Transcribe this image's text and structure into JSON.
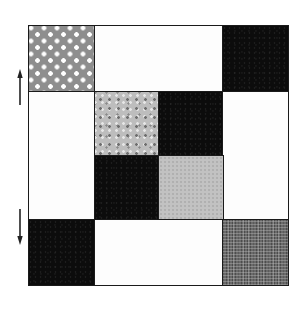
{
  "figure": {
    "grid": {
      "rows": 4,
      "cols": 4,
      "tiles": [
        {
          "id": "r0c0",
          "row": 0,
          "col": 0,
          "rowspan": 1,
          "colspan": 1,
          "pattern": "white-dots-on-gray",
          "color": "#8e8e8e"
        },
        {
          "id": "r0c1",
          "row": 0,
          "col": 1,
          "rowspan": 1,
          "colspan": 2,
          "pattern": "white",
          "color": "#fdfdfd"
        },
        {
          "id": "r0c3",
          "row": 0,
          "col": 3,
          "rowspan": 1,
          "colspan": 1,
          "pattern": "black",
          "color": "#0c0c0c"
        },
        {
          "id": "r1c0",
          "row": 1,
          "col": 0,
          "rowspan": 2,
          "colspan": 1,
          "pattern": "white",
          "color": "#fdfdfd"
        },
        {
          "id": "r1c1",
          "row": 1,
          "col": 1,
          "rowspan": 1,
          "colspan": 1,
          "pattern": "speckled-light-gray",
          "color": "#bdbdbd"
        },
        {
          "id": "r1c2",
          "row": 1,
          "col": 2,
          "rowspan": 1,
          "colspan": 1,
          "pattern": "black",
          "color": "#0c0c0c"
        },
        {
          "id": "r1c3",
          "row": 1,
          "col": 3,
          "rowspan": 2,
          "colspan": 1,
          "pattern": "white",
          "color": "#fdfdfd"
        },
        {
          "id": "r2c1",
          "row": 2,
          "col": 1,
          "rowspan": 1,
          "colspan": 1,
          "pattern": "black",
          "color": "#0c0c0c"
        },
        {
          "id": "r2c2",
          "row": 2,
          "col": 2,
          "rowspan": 1,
          "colspan": 1,
          "pattern": "light-gray",
          "color": "#c2c2c2"
        },
        {
          "id": "r3c0",
          "row": 3,
          "col": 0,
          "rowspan": 1,
          "colspan": 1,
          "pattern": "black",
          "color": "#0c0c0c"
        },
        {
          "id": "r3c1",
          "row": 3,
          "col": 1,
          "rowspan": 1,
          "colspan": 2,
          "pattern": "white",
          "color": "#fdfdfd"
        },
        {
          "id": "r3c3",
          "row": 3,
          "col": 3,
          "rowspan": 1,
          "colspan": 1,
          "pattern": "crosshatch-gray",
          "color": "#6a6a6a"
        }
      ]
    },
    "arrows": [
      {
        "id": "arrow-up",
        "direction": "up",
        "side": "left"
      },
      {
        "id": "arrow-down",
        "direction": "down",
        "side": "left"
      }
    ],
    "colors": {
      "border": "#1a1a1a",
      "background": "#ffffff"
    }
  }
}
